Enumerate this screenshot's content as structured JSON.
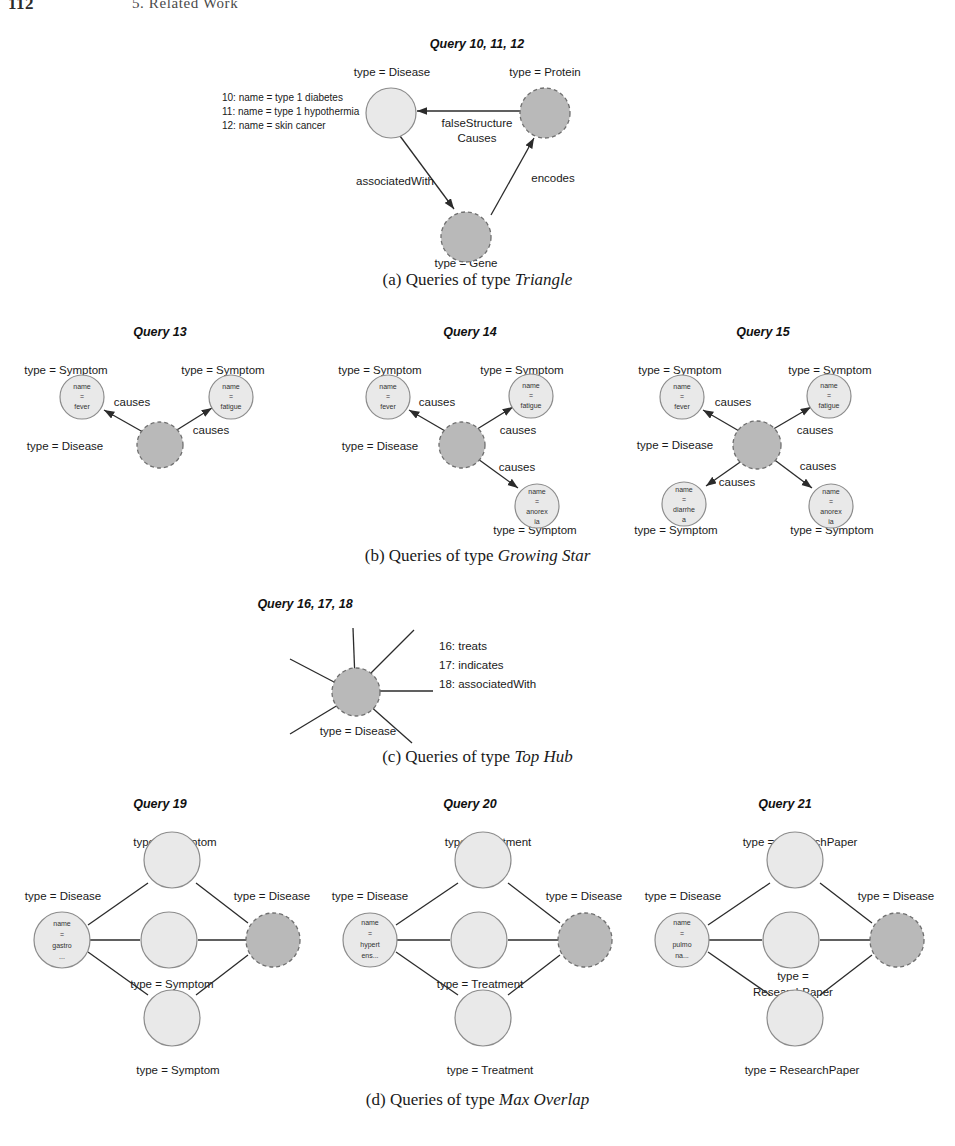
{
  "runninghead": {
    "folio": "112",
    "title": "5. Related Work"
  },
  "colors": {
    "node_light_fill": "#e9e9e9",
    "node_light_stroke": "#8c8c8c",
    "node_dark_fill": "#b9b9b9",
    "node_dark_stroke": "#6f6f6f",
    "edge": "#2b2b2b",
    "text": "#1a1a1a"
  },
  "subfigures": [
    {
      "key": "a",
      "label": "(a) Queries of type ",
      "emph": "Triangle"
    },
    {
      "key": "b",
      "label": "(b) Queries of type ",
      "emph": "Growing Star"
    },
    {
      "key": "c",
      "label": "(c) Queries of type ",
      "emph": "Top Hub"
    },
    {
      "key": "d",
      "label": "(d) Queries of type ",
      "emph": "Max Overlap"
    }
  ],
  "triangle": {
    "title": "Query 10, 11, 12",
    "variants": [
      "10: name = type 1 diabetes",
      "11: name = type 1 hypothermia",
      "12: name = skin cancer"
    ],
    "nodes": [
      {
        "id": "disease",
        "type_label": "type = Disease",
        "style": "light"
      },
      {
        "id": "protein",
        "type_label": "type = Protein",
        "style": "dark"
      },
      {
        "id": "gene",
        "type_label": "type = Gene",
        "style": "dark"
      }
    ],
    "edges": [
      {
        "from": "protein",
        "to": "disease",
        "label_line1": "falseStructure",
        "label_line2": "Causes"
      },
      {
        "from": "disease",
        "to": "gene",
        "label_line1": "associatedWith",
        "label_line2": ""
      },
      {
        "from": "gene",
        "to": "protein",
        "label_line1": "encodes",
        "label_line2": ""
      }
    ]
  },
  "growing_star": {
    "queries": [
      {
        "title": "Query 13",
        "center": {
          "type_label": "type = Disease",
          "style": "dark"
        },
        "leaves": [
          {
            "pos": "upper-left",
            "type_label": "type = Symptom",
            "name_lines": [
              "name",
              "=",
              "fever"
            ],
            "edge_label": "causes"
          },
          {
            "pos": "upper-right",
            "type_label": "type = Symptom",
            "name_lines": [
              "name",
              "=",
              "fatigue"
            ],
            "edge_label": "causes"
          }
        ]
      },
      {
        "title": "Query 14",
        "center": {
          "type_label": "type = Disease",
          "style": "dark"
        },
        "leaves": [
          {
            "pos": "upper-left",
            "type_label": "type = Symptom",
            "name_lines": [
              "name",
              "=",
              "fever"
            ],
            "edge_label": "causes"
          },
          {
            "pos": "upper-right",
            "type_label": "type = Symptom",
            "name_lines": [
              "name",
              "=",
              "fatigue"
            ],
            "edge_label": "causes"
          },
          {
            "pos": "lower-right",
            "type_label": "type = Symptom",
            "name_lines": [
              "name",
              "=",
              "anorex",
              "ia"
            ],
            "edge_label": "causes"
          }
        ]
      },
      {
        "title": "Query 15",
        "center": {
          "type_label": "type = Disease",
          "style": "dark"
        },
        "leaves": [
          {
            "pos": "upper-left",
            "type_label": "type = Symptom",
            "name_lines": [
              "name",
              "=",
              "fever"
            ],
            "edge_label": "causes"
          },
          {
            "pos": "upper-right",
            "type_label": "type = Symptom",
            "name_lines": [
              "name",
              "=",
              "fatigue"
            ],
            "edge_label": "causes"
          },
          {
            "pos": "lower-left",
            "type_label": "type = Symptom",
            "name_lines": [
              "name",
              "=",
              "diarrhe",
              "a"
            ],
            "edge_label": "causes"
          },
          {
            "pos": "lower-right",
            "type_label": "type = Symptom",
            "name_lines": [
              "name",
              "=",
              "anorex",
              "ia"
            ],
            "edge_label": "causes"
          }
        ]
      }
    ]
  },
  "top_hub": {
    "title": "Query 16, 17, 18",
    "center": {
      "type_label": "type = Disease",
      "style": "dark"
    },
    "spoke_count": 6,
    "variants": [
      "16: treats",
      "17: indicates",
      "18: associatedWith"
    ]
  },
  "max_overlap": {
    "queries": [
      {
        "title": "Query 19",
        "left": {
          "type_label": "type = Disease",
          "name_lines": [
            "name",
            "=",
            "gastro",
            "..."
          ],
          "style": "light"
        },
        "right": {
          "type_label": "type = Disease",
          "style": "dark"
        },
        "middle_type": "type = Symptom",
        "middle_label_lines": [
          "type = Symptom"
        ],
        "top_label": "type = Symptom",
        "bottom_label": "type = Symptom",
        "middle_nodes": 3
      },
      {
        "title": "Query 20",
        "left": {
          "type_label": "type = Disease",
          "name_lines": [
            "name",
            "=",
            "hypert",
            "ens..."
          ],
          "style": "light"
        },
        "right": {
          "type_label": "type = Disease",
          "style": "dark"
        },
        "middle_type": "type = Treatment",
        "middle_label_lines": [
          "type = Treatment"
        ],
        "top_label": "type = Treatment",
        "bottom_label": "type = Treatment",
        "middle_nodes": 3
      },
      {
        "title": "Query 21",
        "left": {
          "type_label": "type = Disease",
          "name_lines": [
            "name",
            "=",
            "pulmo",
            "na..."
          ],
          "style": "light"
        },
        "right": {
          "type_label": "type = Disease",
          "style": "dark"
        },
        "middle_type": "type = ResearchPaper",
        "middle_label_lines": [
          "type =",
          "ResearchPaper"
        ],
        "top_label": "type = ResearchPaper",
        "bottom_label": "type = ResearchPaper",
        "middle_nodes": 3
      }
    ]
  }
}
